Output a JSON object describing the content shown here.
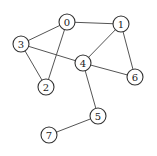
{
  "graph": {
    "type": "undirected",
    "nodes": [
      {
        "id": "0",
        "label": "0",
        "x": 67,
        "y": 22
      },
      {
        "id": "1",
        "label": "1",
        "x": 121,
        "y": 24
      },
      {
        "id": "2",
        "label": "2",
        "x": 46,
        "y": 87
      },
      {
        "id": "3",
        "label": "3",
        "x": 21,
        "y": 44
      },
      {
        "id": "4",
        "label": "4",
        "x": 83,
        "y": 63
      },
      {
        "id": "5",
        "label": "5",
        "x": 98,
        "y": 116
      },
      {
        "id": "6",
        "label": "6",
        "x": 135,
        "y": 77
      },
      {
        "id": "7",
        "label": "7",
        "x": 49,
        "y": 135
      }
    ],
    "edges": [
      {
        "from": "0",
        "to": "1"
      },
      {
        "from": "0",
        "to": "3"
      },
      {
        "from": "0",
        "to": "2"
      },
      {
        "from": "3",
        "to": "2"
      },
      {
        "from": "3",
        "to": "4"
      },
      {
        "from": "1",
        "to": "4"
      },
      {
        "from": "1",
        "to": "6"
      },
      {
        "from": "4",
        "to": "6"
      },
      {
        "from": "4",
        "to": "5"
      },
      {
        "from": "5",
        "to": "7"
      }
    ],
    "node_radius": 8
  }
}
